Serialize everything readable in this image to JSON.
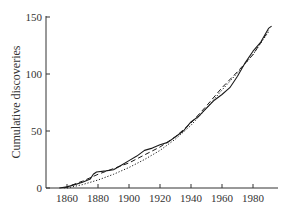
{
  "chart_data": {
    "type": "line",
    "title": "",
    "xlabel": "",
    "ylabel": "Cumulative discoveries",
    "xlim": [
      1852,
      1995
    ],
    "ylim": [
      0,
      150
    ],
    "grid": false,
    "legend": null,
    "x_ticks": [
      1860,
      1880,
      1900,
      1920,
      1940,
      1960,
      1980
    ],
    "y_ticks": [
      0,
      50,
      100,
      150
    ],
    "series": [
      {
        "name": "observed",
        "style": "solid",
        "x": [
          1855,
          1860,
          1865,
          1870,
          1875,
          1877,
          1879,
          1885,
          1890,
          1895,
          1900,
          1905,
          1910,
          1915,
          1920,
          1925,
          1930,
          1935,
          1940,
          1945,
          1950,
          1955,
          1960,
          1965,
          1970,
          1975,
          1980,
          1985,
          1990,
          1992
        ],
        "values": [
          0,
          1,
          3,
          5,
          8,
          12,
          14,
          15,
          16,
          20,
          24,
          28,
          33,
          35,
          38,
          40,
          45,
          50,
          58,
          63,
          70,
          77,
          82,
          88,
          98,
          110,
          120,
          128,
          140,
          142
        ]
      },
      {
        "name": "model-1",
        "style": "dashed",
        "x": [
          1858,
          1860,
          1870,
          1880,
          1890,
          1900,
          1910,
          1920,
          1930,
          1940,
          1950,
          1960,
          1970,
          1980,
          1990
        ],
        "values": [
          0,
          1,
          6,
          12,
          17,
          22,
          29,
          36,
          45,
          57,
          72,
          88,
          102,
          117,
          138
        ]
      },
      {
        "name": "model-2",
        "style": "dotted",
        "x": [
          1860,
          1870,
          1880,
          1890,
          1900,
          1910,
          1920,
          1930,
          1940,
          1950,
          1960,
          1970,
          1980,
          1990
        ],
        "values": [
          0,
          3,
          7,
          12,
          18,
          25,
          33,
          43,
          55,
          70,
          86,
          101,
          117,
          137
        ]
      }
    ]
  },
  "axes": {
    "ylabel": "Cumulative discoveries",
    "x_tick_labels": [
      "1860",
      "1880",
      "1900",
      "1920",
      "1940",
      "1960",
      "1980"
    ],
    "y_tick_labels": [
      "0",
      "50",
      "100",
      "150"
    ]
  },
  "colors": {
    "line": "#1a1a1a",
    "axis": "#333333"
  }
}
